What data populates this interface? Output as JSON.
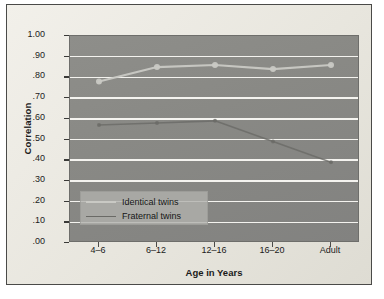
{
  "chart_data": {
    "type": "line",
    "title": "",
    "xlabel": "Age in Years",
    "ylabel": "Correlation",
    "categories": [
      "4–6",
      "6–12",
      "12–16",
      "16–20",
      "Adult"
    ],
    "ylim": [
      0.0,
      1.0
    ],
    "ytick_labels": [
      "1.00",
      ".90",
      ".80",
      ".70",
      ".60",
      ".50",
      ".40",
      ".30",
      ".20",
      ".10",
      ".00"
    ],
    "ytick_values": [
      1.0,
      0.9,
      0.8,
      0.7,
      0.6,
      0.5,
      0.4,
      0.3,
      0.2,
      0.1,
      0.0
    ],
    "grid": true,
    "legend_position": "bottom-left",
    "series": [
      {
        "name": "Identical twins",
        "color": "#c9c9c4",
        "values": [
          0.78,
          0.85,
          0.86,
          0.84,
          0.86
        ]
      },
      {
        "name": "Fraternal twins",
        "color": "#6a6a66",
        "values": [
          0.57,
          0.58,
          0.59,
          0.49,
          0.39
        ]
      }
    ]
  },
  "legend": {
    "items": [
      {
        "label": "Identical twins"
      },
      {
        "label": "Fraternal twins"
      }
    ]
  }
}
